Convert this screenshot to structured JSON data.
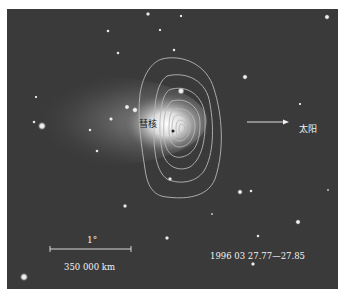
{
  "figure": {
    "labels": {
      "nucleus": "彗核",
      "sun": "太阳",
      "scale_angle": "1°",
      "scale_distance": "350 000 km",
      "date": "1996 03 27.77—27.85"
    },
    "colors": {
      "background_sky": "#3a3a3a",
      "contour": "#b8b8b8",
      "text": "#f2f2f2",
      "page": "#ffffff"
    }
  }
}
